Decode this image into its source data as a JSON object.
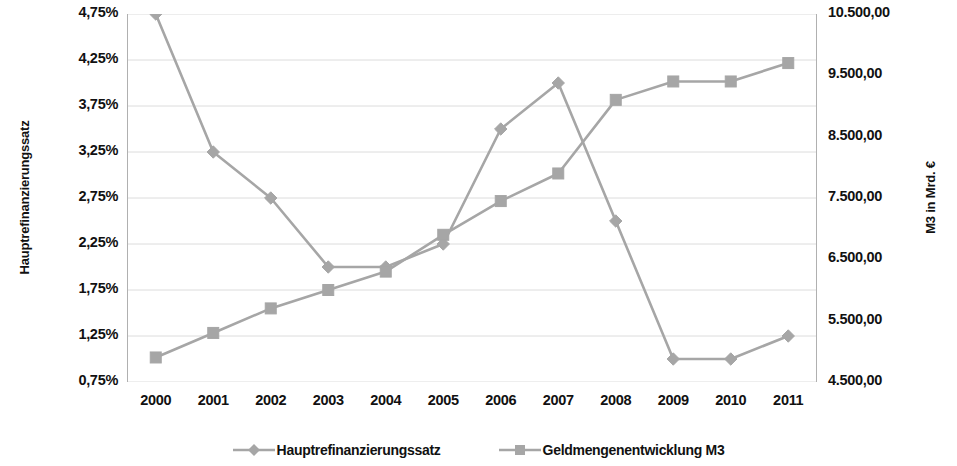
{
  "chart_data": {
    "type": "line",
    "title": "",
    "subtitle": "",
    "xlabel": "",
    "categories": [
      "2000",
      "2001",
      "2002",
      "2003",
      "2004",
      "2005",
      "2006",
      "2007",
      "2008",
      "2009",
      "2010",
      "2011"
    ],
    "grid": true,
    "legend_position": "bottom",
    "axes": {
      "left": {
        "label": "Hauptrefinanzierungssatz",
        "ticks": [
          "0,75%",
          "1,25%",
          "1,75%",
          "2,25%",
          "2,75%",
          "3,25%",
          "3,75%",
          "4,25%",
          "4,75%"
        ],
        "tick_values": [
          0.75,
          1.25,
          1.75,
          2.25,
          2.75,
          3.25,
          3.75,
          4.25,
          4.75
        ],
        "min": 0.75,
        "max": 4.75,
        "step": 0.5,
        "unit": "%"
      },
      "right": {
        "label": "M3 in Mrd. €",
        "ticks": [
          "4.500,00",
          "5.500,00",
          "6.500,00",
          "7.500,00",
          "8.500,00",
          "9.500,00",
          "10.500,00"
        ],
        "tick_values": [
          4500,
          5500,
          6500,
          7500,
          8500,
          9500,
          10500
        ],
        "min": 4500,
        "max": 10500,
        "step": 1000,
        "unit": "Mrd. €"
      }
    },
    "series": [
      {
        "name": "Hauptrefinanzierungssatz",
        "axis": "left",
        "marker": "diamond",
        "color": "#a6a6a6",
        "values": [
          4.75,
          3.25,
          2.75,
          2.0,
          2.0,
          2.25,
          3.5,
          4.0,
          2.5,
          1.0,
          1.0,
          1.25
        ]
      },
      {
        "name": "Geldmengenentwicklung M3",
        "axis": "right",
        "marker": "square",
        "color": "#a6a6a6",
        "values": [
          4900,
          5300,
          5700,
          6000,
          6300,
          6900,
          7450,
          7900,
          9100,
          9400,
          9400,
          9700
        ]
      }
    ]
  },
  "legend": {
    "entries": [
      {
        "label": "Hauptrefinanzierungssatz",
        "marker": "diamond-marker-icon"
      },
      {
        "label": "Geldmengenentwicklung M3",
        "marker": "square-marker-icon"
      }
    ]
  },
  "colors": {
    "series": "#a6a6a6",
    "grid": "#dcdcdc",
    "axis": "#b0b0b0",
    "text": "#111111"
  }
}
